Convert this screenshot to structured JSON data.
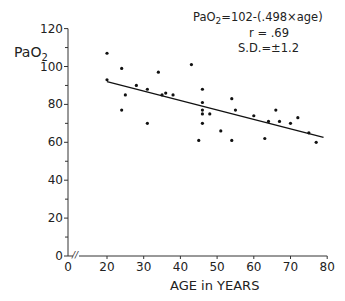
{
  "chart_data": {
    "type": "scatter",
    "title": "",
    "xlabel": "AGE in YEARS",
    "ylabel": "PaO2",
    "xlim": [
      0,
      80
    ],
    "ylim": [
      0,
      120
    ],
    "x_ticks": [
      0,
      20,
      30,
      40,
      50,
      60,
      70,
      80
    ],
    "x_tick_labels": [
      "0",
      "20",
      "30",
      "40",
      "50",
      "60",
      "70",
      "80"
    ],
    "y_ticks": [
      0,
      20,
      40,
      60,
      80,
      100,
      120
    ],
    "y_tick_labels": [
      "0",
      "20",
      "40",
      "60",
      "80",
      "100",
      "120"
    ],
    "y_minor_ticks": [
      10,
      30,
      50,
      70,
      90,
      110
    ],
    "axis_break": "x-axis break between 0 and 20 (//)",
    "grid": false,
    "legend": null,
    "annotations": {
      "equation": "PaO2=102-(.498×age)",
      "equation_prefix": "PaO",
      "equation_sub": "2",
      "equation_rest": "=102-(.498×age)",
      "r": "r = .69",
      "sd": "S.D.=±1.2"
    },
    "regression_line": {
      "intercept": 102,
      "slope": -0.498,
      "x_range": [
        20,
        79
      ]
    },
    "series": [
      {
        "name": "observations",
        "points": [
          {
            "x": 20,
            "y": 107
          },
          {
            "x": 20,
            "y": 93
          },
          {
            "x": 24,
            "y": 99
          },
          {
            "x": 25,
            "y": 85
          },
          {
            "x": 24,
            "y": 77
          },
          {
            "x": 28,
            "y": 90
          },
          {
            "x": 31,
            "y": 88
          },
          {
            "x": 31,
            "y": 70
          },
          {
            "x": 34,
            "y": 97
          },
          {
            "x": 35,
            "y": 85
          },
          {
            "x": 36,
            "y": 86
          },
          {
            "x": 38,
            "y": 85
          },
          {
            "x": 43,
            "y": 101
          },
          {
            "x": 46,
            "y": 88
          },
          {
            "x": 46,
            "y": 81
          },
          {
            "x": 46,
            "y": 77
          },
          {
            "x": 46,
            "y": 75
          },
          {
            "x": 48,
            "y": 75
          },
          {
            "x": 46,
            "y": 70
          },
          {
            "x": 45,
            "y": 61
          },
          {
            "x": 51,
            "y": 66
          },
          {
            "x": 54,
            "y": 83
          },
          {
            "x": 55,
            "y": 77
          },
          {
            "x": 54,
            "y": 61
          },
          {
            "x": 60,
            "y": 74
          },
          {
            "x": 64,
            "y": 71
          },
          {
            "x": 63,
            "y": 62
          },
          {
            "x": 66,
            "y": 77
          },
          {
            "x": 67,
            "y": 71
          },
          {
            "x": 70,
            "y": 70
          },
          {
            "x": 72,
            "y": 73
          },
          {
            "x": 75,
            "y": 65
          },
          {
            "x": 77,
            "y": 60
          }
        ]
      }
    ]
  },
  "labels": {
    "y_axis_prefix": "PaO",
    "y_axis_sub": "2",
    "x_axis": "AGE in YEARS",
    "origin_y": "0",
    "origin_x": "0"
  }
}
